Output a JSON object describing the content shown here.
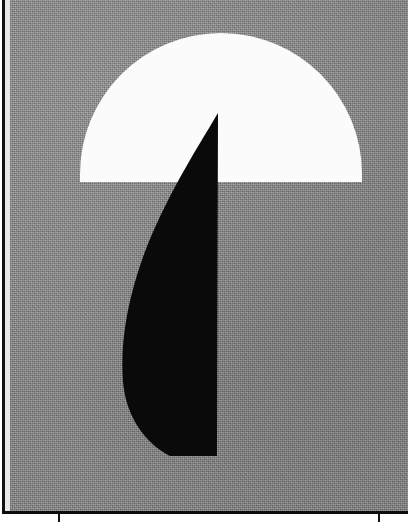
{
  "artwork": {
    "title": "Abstract geometric composition",
    "medium_note": "Printed halftone plate",
    "palette": {
      "background_gray": "#8d8d8d",
      "dome_white": "#fbfbfb",
      "crescent_black": "#0a0a0a",
      "rule_black": "#111111",
      "page_white": "#ffffff",
      "gutter_light": "#e8e8e8"
    },
    "canvas": {
      "width": 408,
      "height": 522
    },
    "plate": {
      "left": 10,
      "top": 0,
      "width": 398,
      "height": 512
    },
    "shapes": [
      {
        "name": "white-dome",
        "kind": "half-ellipse",
        "fill": "#fbfbfb",
        "center_x": 211,
        "baseline_y": 182,
        "semi_width": 141,
        "semi_height": 149,
        "orientation": "opening-downward"
      },
      {
        "name": "black-crescent",
        "kind": "crescent",
        "fill": "#0a0a0a",
        "apex_x": 208,
        "apex_y": 113,
        "tail_x": 207,
        "tail_y": 456,
        "leftmost_x": 113,
        "leftmost_y": 292,
        "straight_edge": "right"
      }
    ],
    "rules": {
      "left_rule_x": 2,
      "left_rule_width": 3,
      "bottom_rule_y": 511,
      "bottom_rule_height": 3
    },
    "tick_marks": [
      {
        "label": "left-registration-tick",
        "x": 58
      },
      {
        "label": "right-registration-tick",
        "x": 378
      }
    ]
  }
}
